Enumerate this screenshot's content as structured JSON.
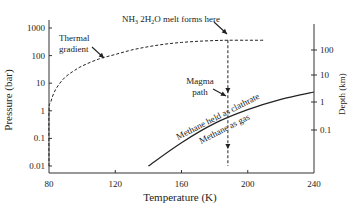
{
  "chart_data": {
    "type": "line",
    "title": "",
    "xlabel": "Temperature (K)",
    "ylabel": "Pressure (bar)",
    "y2label": "Depth (km)",
    "xlim": [
      80,
      240
    ],
    "ylim": [
      0.01,
      1000
    ],
    "yscale": "log",
    "xticks": [
      80,
      120,
      160,
      200,
      240
    ],
    "xtick_labels": [
      "80",
      "120",
      "160",
      "200",
      "240"
    ],
    "yticks": [
      0.01,
      0.1,
      1,
      10,
      100,
      1000
    ],
    "ytick_labels": [
      "0.01",
      "0.1",
      "1",
      "10",
      "100",
      "1000"
    ],
    "y2ticks_at_pressure": [
      0.4,
      3.5,
      30,
      250
    ],
    "y2tick_labels": [
      "0.1",
      "1",
      "10",
      "100"
    ],
    "grid": false,
    "series": [
      {
        "name": "Thermal gradient",
        "style": "dashed",
        "x": [
          80,
          80,
          81,
          83,
          86,
          90,
          95,
          100,
          110,
          120,
          130,
          140,
          150,
          160,
          170,
          180,
          188,
          200,
          210
        ],
        "y": [
          0.01,
          1,
          2,
          4.5,
          9,
          17,
          28,
          42,
          75,
          110,
          160,
          210,
          260,
          300,
          330,
          350,
          360,
          360,
          360
        ]
      },
      {
        "name": "Magma path",
        "style": "dashed",
        "x": [
          188,
          188
        ],
        "y": [
          360,
          0.01
        ]
      },
      {
        "name": "Methane clathrate / gas boundary",
        "style": "solid",
        "x": [
          140,
          160,
          180,
          200,
          220,
          240
        ],
        "y": [
          0.01,
          0.07,
          0.35,
          1.1,
          2.6,
          4.8
        ]
      }
    ],
    "annotations": [
      {
        "text": "Thermal",
        "text2": "gradient",
        "points_to": "Thermal gradient"
      },
      {
        "text_parts": [
          "NH",
          "3",
          " 2H",
          "2",
          "O melt forms here"
        ],
        "points_to": "melt point"
      },
      {
        "text": "Magma",
        "text2": "path",
        "points_to": "Magma path"
      },
      {
        "text": "Methane held as clathrate",
        "position": "above curve"
      },
      {
        "text": "Methane as gas",
        "position": "below curve"
      }
    ]
  }
}
